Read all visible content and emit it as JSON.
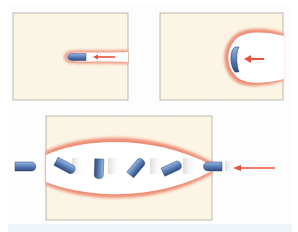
{
  "diagram": {
    "title": "",
    "colors": {
      "material": "#fcf6e6",
      "material_border": "#a8a8a0",
      "heat_zone": "#e86a50",
      "projectile": "#5a7fb8",
      "projectile_dark": "#2f4a7a",
      "arrow": "#e8503c",
      "strip": "#eef4f8"
    },
    "panels": [
      {
        "id": "panel-1",
        "label": "",
        "stage": "narrow penetration channel",
        "arrow_direction": "left"
      },
      {
        "id": "panel-2",
        "label": "",
        "stage": "flattened projectile in wide cavity",
        "arrow_direction": "left"
      },
      {
        "id": "panel-3",
        "label": "",
        "stage": "tumbling projectile through cavity",
        "arrow_direction": "left",
        "projectile_count": 6
      }
    ]
  }
}
